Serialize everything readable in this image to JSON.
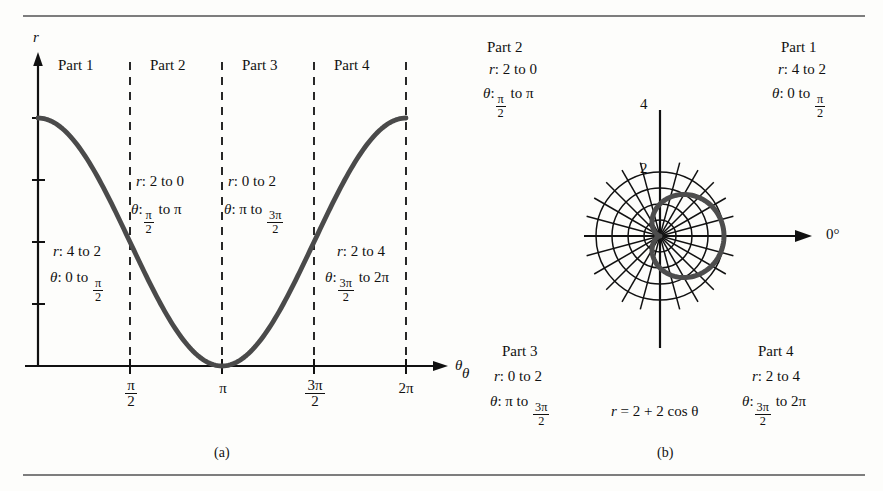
{
  "figure": {
    "background": "#fdfdfb",
    "ink": "#111111",
    "curve_color": "#4a4a4a",
    "rule_color": "#7d7d7d"
  },
  "panel_a": {
    "caption": "(a)",
    "y_axis_label": "r",
    "x_axis_label": "θ",
    "x_tick_labels": [
      "π/2",
      "π",
      "3π/2",
      "2π"
    ],
    "x_tick_pi_over_2_num": "π",
    "x_tick_pi_over_2_den": "2",
    "x_tick_pi": "π",
    "x_tick_3pi_over_2_num": "3π",
    "x_tick_3pi_over_2_den": "2",
    "x_tick_2pi": "2π",
    "parts": [
      {
        "name": "Part 1",
        "r_text": "r : 4 to 2",
        "r_prefix": "r",
        "r_range": ": 4 to 2",
        "theta_prefix": "θ",
        "theta_head": ": 0 to ",
        "theta_frac_num": "π",
        "theta_frac_den": "2",
        "theta_tail": ""
      },
      {
        "name": "Part 2",
        "r_text": "r : 2 to 0",
        "r_prefix": "r",
        "r_range": ": 2 to 0",
        "theta_prefix": "θ",
        "theta_head": ":",
        "theta_frac_num": "π",
        "theta_frac_den": "2",
        "theta_tail": " to π"
      },
      {
        "name": "Part 3",
        "r_text": "r : 0 to 2",
        "r_prefix": "r",
        "r_range": ": 0 to 2",
        "theta_prefix": "θ",
        "theta_head": ": π to ",
        "theta_frac_num": "3π",
        "theta_frac_den": "2",
        "theta_tail": ""
      },
      {
        "name": "Part 4",
        "r_text": "r : 2 to 4",
        "r_prefix": "r",
        "r_range": ": 2 to 4",
        "theta_prefix": "θ",
        "theta_head": ":",
        "theta_frac_num": "3π",
        "theta_frac_den": "2",
        "theta_tail": " to 2π"
      }
    ]
  },
  "panel_b": {
    "caption": "(b)",
    "polar_axis_label": "0°",
    "radial_labels": [
      "2",
      "4"
    ],
    "equation_lhs": "r",
    "equation_rhs": "= 2 + 2 cos θ",
    "equation_theta": "θ",
    "stray_theta": "θ",
    "parts": [
      {
        "name": "Part 1",
        "r_prefix": "r",
        "r_range": ": 4 to 2",
        "theta_prefix": "θ",
        "theta_head": ": 0 to ",
        "theta_frac_num": "π",
        "theta_frac_den": "2",
        "theta_tail": ""
      },
      {
        "name": "Part 2",
        "r_prefix": "r",
        "r_range": ": 2 to 0",
        "theta_prefix": "θ",
        "theta_head": ":",
        "theta_frac_num": "π",
        "theta_frac_den": "2",
        "theta_tail": " to π"
      },
      {
        "name": "Part 3",
        "r_prefix": "r",
        "r_range": ": 0 to 2",
        "theta_prefix": "θ",
        "theta_head": ": π to ",
        "theta_frac_num": "3π",
        "theta_frac_den": "2",
        "theta_tail": ""
      },
      {
        "name": "Part 4",
        "r_prefix": "r",
        "r_range": ": 2 to 4",
        "theta_prefix": "θ",
        "theta_head": ":",
        "theta_frac_num": "3π",
        "theta_frac_den": "2",
        "theta_tail": " to 2π"
      }
    ]
  },
  "chart_data": [
    {
      "type": "line",
      "panel": "(a)",
      "title": "",
      "xlabel": "θ",
      "ylabel": "r",
      "equation": "r = 2 + 2 cos θ",
      "xlim": [
        0,
        6.283185307179586
      ],
      "ylim": [
        0,
        4.4
      ],
      "xticks": [
        1.5707963267948966,
        3.141592653589793,
        4.71238898038469,
        6.283185307179586
      ],
      "xticklabels": [
        "π/2",
        "π",
        "3π/2",
        "2π"
      ],
      "yticks": [
        1,
        2,
        3,
        4
      ],
      "yticklabels": [
        "",
        "",
        "",
        ""
      ],
      "grid": false,
      "vertical_dashed_lines_at": [
        1.5707963267948966,
        3.141592653589793,
        4.71238898038469,
        6.283185307179586
      ],
      "x": [
        0.0,
        0.3141592653589793,
        0.6283185307179586,
        0.9424777960769379,
        1.2566370614359172,
        1.5707963267948966,
        1.8849555921538759,
        2.199114857512855,
        2.5132741228718345,
        2.827433388230814,
        3.141592653589793,
        3.455751918948773,
        3.7699111843077517,
        4.084070449666731,
        4.39822971502571,
        4.71238898038469,
        5.026548245743669,
        5.340707511102648,
        5.654866776461628,
        5.969026041820607,
        6.283185307179586
      ],
      "y": [
        4.0,
        3.902,
        3.618,
        3.176,
        2.618,
        2.0,
        1.382,
        0.824,
        0.382,
        0.098,
        0.0,
        0.098,
        0.382,
        0.824,
        1.382,
        2.0,
        2.618,
        3.176,
        3.618,
        3.902,
        4.0
      ],
      "segments": [
        {
          "name": "Part 1",
          "r": "4 to 2",
          "theta": "0 to π/2"
        },
        {
          "name": "Part 2",
          "r": "2 to 0",
          "theta": "π/2 to π"
        },
        {
          "name": "Part 3",
          "r": "0 to 2",
          "theta": "π to 3π/2"
        },
        {
          "name": "Part 4",
          "r": "2 to 4",
          "theta": "3π/2 to 2π"
        }
      ]
    },
    {
      "type": "line",
      "panel": "(b)",
      "coordinate_system": "polar",
      "title": "",
      "equation": "r = 2 + 2 cos θ",
      "rlim": [
        0,
        4
      ],
      "r_gridlines": [
        1,
        2,
        3,
        4
      ],
      "r_labeled": [
        2,
        4
      ],
      "theta_gridline_step_deg": 15,
      "theta_zero_label": "0°",
      "grid": true,
      "theta_deg": [
        0,
        15,
        30,
        45,
        60,
        75,
        90,
        105,
        120,
        135,
        150,
        165,
        180,
        195,
        210,
        225,
        240,
        255,
        270,
        285,
        300,
        315,
        330,
        345,
        360
      ],
      "r": [
        4.0,
        3.932,
        3.732,
        3.414,
        3.0,
        2.518,
        2.0,
        1.482,
        1.0,
        0.586,
        0.268,
        0.068,
        0.0,
        0.068,
        0.268,
        0.586,
        1.0,
        1.482,
        2.0,
        2.518,
        3.0,
        3.414,
        3.732,
        3.932,
        4.0
      ],
      "segments": [
        {
          "name": "Part 1",
          "r": "4 to 2",
          "theta": "0 to π/2"
        },
        {
          "name": "Part 2",
          "r": "2 to 0",
          "theta": "π/2 to π"
        },
        {
          "name": "Part 3",
          "r": "0 to 2",
          "theta": "π to 3π/2"
        },
        {
          "name": "Part 4",
          "r": "2 to 4",
          "theta": "3π/2 to 2π"
        }
      ]
    }
  ]
}
